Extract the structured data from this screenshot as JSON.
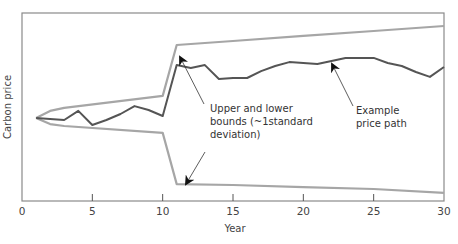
{
  "chart_data": {
    "type": "line",
    "title": "",
    "xlabel": "Year",
    "ylabel": "Carbon price",
    "xlim": [
      0,
      30
    ],
    "ylim": [
      0,
      100
    ],
    "x_ticks": [
      0,
      5,
      10,
      15,
      20,
      25,
      30
    ],
    "y_ticks": [],
    "grid": false,
    "legend": null,
    "series": [
      {
        "name": "Example price path",
        "color": "#555555",
        "x": [
          1,
          2,
          3,
          4,
          5,
          6,
          7,
          8,
          9,
          10,
          11,
          12,
          13,
          14,
          15,
          16,
          17,
          18,
          19,
          20,
          21,
          22,
          23,
          24,
          25,
          26,
          27,
          28,
          29,
          30
        ],
        "values": [
          44.1,
          43.6,
          43.1,
          47.9,
          40.4,
          43.1,
          46.3,
          50.5,
          48.4,
          45.2,
          72.3,
          70.7,
          72.3,
          64.9,
          65.4,
          65.4,
          69.1,
          71.8,
          73.9,
          73.4,
          72.9,
          74.5,
          76.1,
          76.1,
          76.1,
          73.4,
          71.8,
          68.6,
          66.0,
          71.3
        ]
      },
      {
        "name": "Upper bound (~1 standard deviation)",
        "color": "#a6a6a6",
        "x": [
          1,
          2,
          3,
          10,
          11,
          15,
          20,
          25,
          30
        ],
        "values": [
          44.1,
          47.9,
          49.5,
          55.9,
          83.0,
          85.1,
          87.8,
          90.4,
          93.1
        ]
      },
      {
        "name": "Lower bound (~1 standard deviation)",
        "color": "#a6a6a6",
        "x": [
          1,
          2,
          3,
          10,
          11,
          15,
          20,
          25,
          30
        ],
        "values": [
          44.1,
          40.9,
          39.9,
          36.2,
          9.0,
          8.5,
          7.4,
          6.4,
          4.3
        ]
      }
    ],
    "annotations": [
      {
        "text_lines": [
          "Upper and lower",
          "bounds (~1standard",
          "deviation)"
        ],
        "arrows_to": [
          {
            "x": 11.2,
            "y": 77
          },
          {
            "x": 11.7,
            "y": 10.5
          }
        ]
      },
      {
        "text_lines": [
          "Example",
          "price path"
        ],
        "arrows_to": [
          {
            "x": 22.2,
            "y": 72
          }
        ]
      }
    ]
  },
  "axes": {
    "x_title": "Year",
    "y_title": "Carbon price",
    "x_tick_labels": [
      "0",
      "5",
      "10",
      "15",
      "20",
      "25",
      "30"
    ]
  },
  "annotations": {
    "bounds": {
      "line1": "Upper and lower",
      "line2": "bounds (~1standard",
      "line3": "deviation)"
    },
    "path": {
      "line1": "Example",
      "line2": "price path"
    }
  }
}
